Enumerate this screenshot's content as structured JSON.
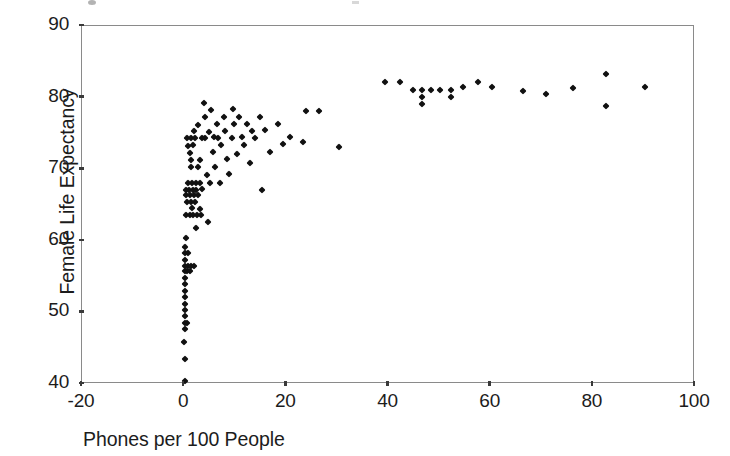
{
  "chart_data": {
    "type": "scatter",
    "title": "",
    "xlabel": "Phones per 100 People",
    "ylabel": "Female Life Expectancy",
    "xlim": [
      -20,
      100
    ],
    "ylim": [
      40,
      90
    ],
    "xticks": [
      -20,
      0,
      20,
      40,
      60,
      80,
      100
    ],
    "yticks": [
      40,
      50,
      60,
      70,
      80,
      90
    ],
    "xtick_labels": [
      "-20",
      "0",
      "20",
      "40",
      "60",
      "80",
      "100"
    ],
    "ytick_labels": [
      "40",
      "50",
      "60",
      "70",
      "80",
      "90"
    ],
    "grid": false,
    "legend": null,
    "marker": "diamond",
    "marker_color": "#111111",
    "points": [
      [
        0.3,
        40.3
      ],
      [
        0.3,
        43.4
      ],
      [
        0.2,
        45.7
      ],
      [
        0.4,
        47.6
      ],
      [
        0.3,
        48.4
      ],
      [
        0.8,
        48.4
      ],
      [
        0.4,
        49.3
      ],
      [
        0.3,
        50.2
      ],
      [
        0.4,
        51.1
      ],
      [
        0.3,
        52.0
      ],
      [
        0.4,
        52.9
      ],
      [
        0.3,
        53.8
      ],
      [
        0.3,
        54.7
      ],
      [
        0.3,
        55.6
      ],
      [
        0.8,
        55.6
      ],
      [
        1.3,
        55.6
      ],
      [
        0.3,
        56.3
      ],
      [
        0.9,
        56.3
      ],
      [
        1.5,
        56.3
      ],
      [
        2.1,
        56.3
      ],
      [
        0.4,
        57.2
      ],
      [
        0.4,
        58.1
      ],
      [
        1.0,
        58.1
      ],
      [
        0.4,
        59.0
      ],
      [
        0.5,
        60.2
      ],
      [
        2.6,
        61.6
      ],
      [
        4.8,
        62.5
      ],
      [
        0.6,
        63.5
      ],
      [
        1.3,
        63.5
      ],
      [
        2.0,
        63.5
      ],
      [
        2.7,
        63.5
      ],
      [
        3.4,
        63.5
      ],
      [
        1.7,
        64.5
      ],
      [
        3.3,
        64.3
      ],
      [
        0.7,
        65.3
      ],
      [
        1.5,
        65.3
      ],
      [
        2.3,
        65.3
      ],
      [
        0.6,
        66.2
      ],
      [
        1.4,
        66.2
      ],
      [
        2.2,
        66.2
      ],
      [
        3.0,
        66.2
      ],
      [
        0.5,
        67.0
      ],
      [
        1.2,
        67.0
      ],
      [
        1.9,
        67.0
      ],
      [
        2.6,
        67.0
      ],
      [
        3.6,
        67.1
      ],
      [
        15.5,
        67.0
      ],
      [
        0.9,
        68.0
      ],
      [
        1.7,
        68.0
      ],
      [
        2.5,
        68.0
      ],
      [
        3.2,
        68.0
      ],
      [
        5.2,
        68.0
      ],
      [
        7.2,
        68.0
      ],
      [
        4.6,
        69.1
      ],
      [
        9.0,
        69.2
      ],
      [
        1.5,
        70.2
      ],
      [
        3.0,
        70.2
      ],
      [
        6.3,
        70.2
      ],
      [
        13.0,
        70.7
      ],
      [
        1.6,
        71.2
      ],
      [
        3.2,
        71.2
      ],
      [
        8.6,
        71.3
      ],
      [
        30.5,
        73.0
      ],
      [
        1.4,
        72.1
      ],
      [
        5.8,
        72.2
      ],
      [
        10.5,
        72.0
      ],
      [
        17.0,
        72.3
      ],
      [
        1.0,
        73.1
      ],
      [
        2.0,
        73.2
      ],
      [
        7.5,
        73.2
      ],
      [
        12.0,
        73.3
      ],
      [
        19.5,
        73.4
      ],
      [
        23.5,
        73.6
      ],
      [
        0.8,
        74.2
      ],
      [
        1.6,
        74.2
      ],
      [
        2.4,
        74.2
      ],
      [
        3.6,
        74.2
      ],
      [
        4.3,
        74.2
      ],
      [
        6.0,
        74.3
      ],
      [
        6.8,
        74.2
      ],
      [
        9.5,
        74.2
      ],
      [
        11.5,
        74.3
      ],
      [
        14.0,
        74.2
      ],
      [
        21.0,
        74.3
      ],
      [
        2.1,
        75.2
      ],
      [
        5.0,
        75.1
      ],
      [
        8.2,
        75.2
      ],
      [
        13.5,
        75.2
      ],
      [
        16.0,
        75.3
      ],
      [
        3.0,
        76.1
      ],
      [
        6.6,
        76.2
      ],
      [
        10.0,
        76.2
      ],
      [
        12.5,
        76.2
      ],
      [
        18.5,
        76.2
      ],
      [
        4.2,
        77.1
      ],
      [
        8.0,
        77.2
      ],
      [
        11.0,
        77.1
      ],
      [
        15.0,
        77.2
      ],
      [
        5.5,
        78.1
      ],
      [
        9.8,
        78.2
      ],
      [
        24.0,
        78.0
      ],
      [
        26.5,
        78.0
      ],
      [
        4.0,
        79.1
      ],
      [
        39.5,
        82.1
      ],
      [
        42.5,
        82.1
      ],
      [
        45.0,
        80.9
      ],
      [
        46.8,
        80.9
      ],
      [
        48.5,
        80.9
      ],
      [
        46.8,
        80.0
      ],
      [
        46.8,
        79.0
      ],
      [
        50.3,
        80.9
      ],
      [
        52.5,
        80.9
      ],
      [
        52.5,
        80.0
      ],
      [
        54.8,
        81.4
      ],
      [
        57.8,
        82.0
      ],
      [
        60.5,
        81.3
      ],
      [
        66.5,
        80.8
      ],
      [
        71.0,
        80.4
      ],
      [
        76.3,
        81.2
      ],
      [
        82.8,
        83.2
      ],
      [
        82.8,
        78.7
      ],
      [
        90.5,
        81.3
      ]
    ]
  },
  "axes": {
    "frame": {
      "left": 81,
      "top": 25,
      "width": 613,
      "height": 358
    }
  }
}
